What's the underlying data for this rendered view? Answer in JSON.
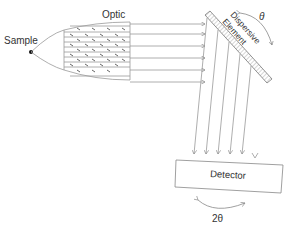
{
  "diagram": {
    "labels": {
      "sample": "Sample",
      "optic": "Optic",
      "dispersive_line1": "Dispersive",
      "dispersive_line2": "Element",
      "theta": "θ",
      "detector": "Detector",
      "two_theta": "2θ"
    },
    "colors": {
      "line": "#888888",
      "text": "#333333",
      "point": "#111111"
    }
  }
}
